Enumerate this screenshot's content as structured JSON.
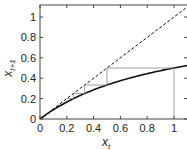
{
  "chart_data": {
    "type": "line",
    "title": "",
    "xlabel": "x_t",
    "ylabel": "x_{t+1}",
    "xlim": [
      0,
      1.1
    ],
    "ylim": [
      0,
      1.1
    ],
    "grid": false,
    "x_ticks": [
      0,
      0.2,
      0.4,
      0.6,
      0.8,
      1
    ],
    "x_tick_labels": [
      "0",
      "0.2",
      "0.4",
      "0.6",
      "0.8",
      "1"
    ],
    "y_ticks": [
      0,
      0.2,
      0.4,
      0.6,
      0.8,
      1
    ],
    "y_tick_labels": [
      "0",
      "0.2",
      "0.4",
      "0.6",
      "0.8",
      "1"
    ],
    "series": [
      {
        "name": "map f(x_t) = x_t/(1+x_t)",
        "style": "solid",
        "color": "#111111",
        "x": [
          0,
          0.1,
          0.2,
          0.3,
          0.4,
          0.5,
          0.6,
          0.7,
          0.8,
          0.9,
          1.0,
          1.1
        ],
        "values": [
          0,
          0.091,
          0.167,
          0.231,
          0.286,
          0.333,
          0.375,
          0.412,
          0.444,
          0.474,
          0.5,
          0.524
        ]
      },
      {
        "name": "identity x_{t+1} = x_t",
        "style": "dashed",
        "color": "#111111",
        "x": [
          0,
          1.1
        ],
        "values": [
          0,
          1.1
        ]
      },
      {
        "name": "cobweb iteration",
        "style": "thin solid",
        "color": "#888888",
        "points": [
          [
            1,
            0
          ],
          [
            1,
            0.5
          ],
          [
            0.5,
            0.5
          ],
          [
            0.5,
            0.333
          ],
          [
            0.333,
            0.333
          ],
          [
            0.333,
            0.25
          ],
          [
            0.25,
            0.25
          ],
          [
            0.25,
            0.2
          ],
          [
            0.2,
            0.2
          ]
        ]
      }
    ],
    "legend": null
  }
}
